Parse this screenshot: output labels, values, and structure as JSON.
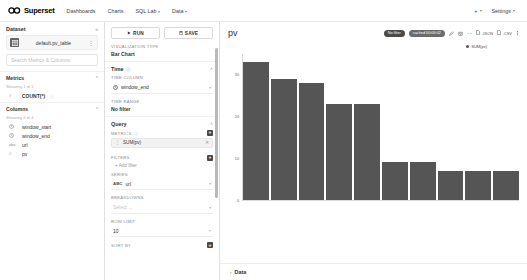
{
  "navbar": {
    "brand": "Superset",
    "links": [
      {
        "label": "Dashboards",
        "caret": false
      },
      {
        "label": "Charts",
        "caret": false
      },
      {
        "label": "SQL Lab",
        "caret": true
      },
      {
        "label": "Data",
        "caret": true
      }
    ],
    "plus_label": "+",
    "settings_label": "Settings",
    "caret": "▾"
  },
  "dataset_panel": {
    "title": "Dataset",
    "collapse_icon": "»",
    "dataset_name": "default.pv_table",
    "search_placeholder": "Search Metrics & Columns",
    "metrics": {
      "title": "Metrics",
      "showing": "Showing 1 of 1",
      "items": [
        {
          "type": "#",
          "label": "COUNT(*)",
          "info": "ⓘ"
        }
      ]
    },
    "columns": {
      "title": "Columns",
      "showing": "Showing 4 of 4",
      "items": [
        {
          "type": "clock",
          "label": "window_start"
        },
        {
          "type": "clock",
          "label": "window_end"
        },
        {
          "type": "abc",
          "label": "url"
        },
        {
          "type": "#",
          "label": "pv"
        }
      ]
    }
  },
  "control_panel": {
    "run_label": "RUN",
    "save_label": "SAVE",
    "viz_type_label": "VISUALIZATION TYPE",
    "viz_type_value": "Bar Chart",
    "time": {
      "title": "Time",
      "info": "ⓘ",
      "time_column_label": "TIME COLUMN",
      "time_column_value": "window_end",
      "time_range_label": "TIME RANGE",
      "time_range_value": "No filter"
    },
    "query": {
      "title": "Query",
      "metrics_label": "METRICS",
      "metrics_info": "ⓘ",
      "metric_chip": "SUM(pv)",
      "filters_label": "FILTERS",
      "add_filter": "+ Add filter",
      "series_label": "SERIES",
      "series_badge": "ABC",
      "series_value": "url",
      "breakdowns_label": "BREAKDOWNS",
      "breakdowns_placeholder": "Select ...",
      "row_limit_label": "ROW LIMIT",
      "row_limit_value": "10",
      "sort_by_label": "SORT BY"
    },
    "plus_glyph": "+",
    "caret": "▾",
    "collapse_icon": "˄"
  },
  "chart_header": {
    "title": "pv",
    "badge_filter": "No filter",
    "badge_cached": "cached 00:00:02",
    "json_label": ".JSON",
    "csv_label": ".CSV"
  },
  "chart_data": {
    "type": "bar",
    "title": "pv",
    "legend": [
      "SUM(pv)"
    ],
    "legend_position": "top-right",
    "xlabel": "",
    "ylabel": "",
    "ylim": [
      0,
      35
    ],
    "yticks": [
      0,
      10,
      20,
      30
    ],
    "grid": false,
    "categories": [
      "/analytics/overview",
      "/product/details",
      "/search/results",
      "/user/profile",
      "/checkout/cart",
      "/settings/account",
      "/home/dashboard",
      "/orders/history",
      "/help/support",
      "/reports/monthly"
    ],
    "series": [
      {
        "name": "SUM(pv)",
        "values": [
          33,
          29,
          28,
          23,
          23,
          9,
          9,
          7,
          7,
          7
        ]
      }
    ]
  },
  "data_section": {
    "label": "Data",
    "caret": "›"
  }
}
